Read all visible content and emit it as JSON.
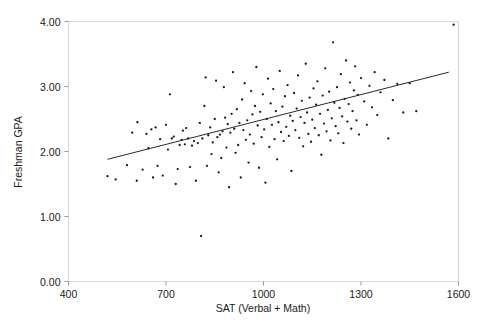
{
  "chart_data": {
    "type": "scatter",
    "title": "",
    "xlabel": "SAT (Verbal + Math)",
    "ylabel": "Freshman GPA",
    "xlim": [
      400,
      1600
    ],
    "ylim": [
      0.0,
      4.0
    ],
    "xticks": [
      400,
      700,
      1000,
      1300,
      1600
    ],
    "xtick_labels": [
      "400",
      "700",
      "1000",
      "1300",
      "1600"
    ],
    "yticks": [
      0.0,
      1.0,
      2.0,
      3.0,
      4.0
    ],
    "ytick_labels": [
      "0.00",
      "1.00",
      "2.00",
      "3.00",
      "4.00"
    ],
    "grid": false,
    "legend": null,
    "marker": "dot",
    "marker_color": "#1a1a1a",
    "trendline": {
      "label": "linear fit",
      "color": "#2a2a2a",
      "x_start": 520,
      "y_start": 1.88,
      "x_end": 1570,
      "y_end": 3.22
    },
    "points": [
      [
        520,
        1.62
      ],
      [
        545,
        1.57
      ],
      [
        580,
        1.79
      ],
      [
        596,
        2.29
      ],
      [
        610,
        1.55
      ],
      [
        612,
        2.45
      ],
      [
        628,
        1.72
      ],
      [
        640,
        2.27
      ],
      [
        646,
        2.05
      ],
      [
        655,
        2.34
      ],
      [
        660,
        1.6
      ],
      [
        668,
        2.37
      ],
      [
        674,
        1.78
      ],
      [
        682,
        2.19
      ],
      [
        690,
        1.63
      ],
      [
        700,
        2.41
      ],
      [
        706,
        2.03
      ],
      [
        712,
        2.88
      ],
      [
        718,
        2.2
      ],
      [
        724,
        2.23
      ],
      [
        730,
        1.5
      ],
      [
        736,
        1.73
      ],
      [
        742,
        2.1
      ],
      [
        748,
        2.18
      ],
      [
        752,
        2.32
      ],
      [
        758,
        2.11
      ],
      [
        762,
        2.36
      ],
      [
        768,
        2.2
      ],
      [
        774,
        1.76
      ],
      [
        780,
        2.09
      ],
      [
        786,
        2.16
      ],
      [
        792,
        1.55
      ],
      [
        798,
        2.13
      ],
      [
        804,
        2.44
      ],
      [
        808,
        0.7
      ],
      [
        812,
        2.2
      ],
      [
        818,
        2.7
      ],
      [
        822,
        3.14
      ],
      [
        826,
        1.78
      ],
      [
        830,
        2.25
      ],
      [
        836,
        2.37
      ],
      [
        840,
        1.96
      ],
      [
        844,
        2.14
      ],
      [
        850,
        2.5
      ],
      [
        854,
        3.09
      ],
      [
        858,
        2.22
      ],
      [
        862,
        1.68
      ],
      [
        866,
        2.26
      ],
      [
        870,
        1.9
      ],
      [
        874,
        2.31
      ],
      [
        878,
        2.99
      ],
      [
        882,
        2.52
      ],
      [
        886,
        2.06
      ],
      [
        890,
        2.42
      ],
      [
        894,
        1.45
      ],
      [
        898,
        2.29
      ],
      [
        902,
        2.58
      ],
      [
        906,
        3.22
      ],
      [
        910,
        2.35
      ],
      [
        914,
        1.98
      ],
      [
        918,
        2.65
      ],
      [
        922,
        2.1
      ],
      [
        926,
        2.44
      ],
      [
        930,
        1.6
      ],
      [
        934,
        2.8
      ],
      [
        938,
        2.33
      ],
      [
        942,
        3.05
      ],
      [
        946,
        2.18
      ],
      [
        950,
        2.48
      ],
      [
        954,
        1.83
      ],
      [
        958,
        2.26
      ],
      [
        962,
        2.93
      ],
      [
        966,
        2.57
      ],
      [
        970,
        2.12
      ],
      [
        974,
        2.7
      ],
      [
        978,
        3.3
      ],
      [
        982,
        2.4
      ],
      [
        986,
        1.75
      ],
      [
        990,
        2.61
      ],
      [
        994,
        2.22
      ],
      [
        998,
        2.88
      ],
      [
        1002,
        2.34
      ],
      [
        1006,
        1.52
      ],
      [
        1010,
        2.5
      ],
      [
        1014,
        3.12
      ],
      [
        1018,
        2.07
      ],
      [
        1022,
        2.74
      ],
      [
        1026,
        2.41
      ],
      [
        1030,
        2.96
      ],
      [
        1034,
        2.19
      ],
      [
        1038,
        2.62
      ],
      [
        1042,
        1.88
      ],
      [
        1046,
        2.45
      ],
      [
        1050,
        3.24
      ],
      [
        1054,
        2.3
      ],
      [
        1058,
        2.69
      ],
      [
        1062,
        2.16
      ],
      [
        1066,
        2.85
      ],
      [
        1070,
        2.38
      ],
      [
        1074,
        3.02
      ],
      [
        1078,
        2.24
      ],
      [
        1082,
        2.55
      ],
      [
        1086,
        1.7
      ],
      [
        1090,
        2.47
      ],
      [
        1094,
        2.9
      ],
      [
        1098,
        2.33
      ],
      [
        1102,
        2.66
      ],
      [
        1106,
        3.17
      ],
      [
        1110,
        2.21
      ],
      [
        1114,
        2.53
      ],
      [
        1118,
        2.78
      ],
      [
        1122,
        2.08
      ],
      [
        1126,
        2.44
      ],
      [
        1130,
        3.35
      ],
      [
        1134,
        2.6
      ],
      [
        1138,
        2.27
      ],
      [
        1142,
        2.83
      ],
      [
        1146,
        2.15
      ],
      [
        1150,
        2.49
      ],
      [
        1154,
        2.97
      ],
      [
        1158,
        2.36
      ],
      [
        1162,
        2.72
      ],
      [
        1166,
        3.08
      ],
      [
        1170,
        2.25
      ],
      [
        1174,
        2.58
      ],
      [
        1178,
        1.95
      ],
      [
        1182,
        2.86
      ],
      [
        1186,
        2.43
      ],
      [
        1190,
        3.28
      ],
      [
        1194,
        2.31
      ],
      [
        1198,
        2.64
      ],
      [
        1202,
        2.92
      ],
      [
        1206,
        2.17
      ],
      [
        1210,
        2.51
      ],
      [
        1214,
        3.68
      ],
      [
        1218,
        2.75
      ],
      [
        1222,
        2.39
      ],
      [
        1226,
        2.99
      ],
      [
        1230,
        2.28
      ],
      [
        1234,
        2.67
      ],
      [
        1238,
        3.19
      ],
      [
        1242,
        2.54
      ],
      [
        1246,
        2.13
      ],
      [
        1250,
        2.81
      ],
      [
        1254,
        3.4
      ],
      [
        1258,
        2.46
      ],
      [
        1262,
        2.73
      ],
      [
        1266,
        3.06
      ],
      [
        1270,
        2.35
      ],
      [
        1274,
        2.62
      ],
      [
        1278,
        2.94
      ],
      [
        1282,
        3.31
      ],
      [
        1286,
        2.48
      ],
      [
        1290,
        2.87
      ],
      [
        1294,
        2.26
      ],
      [
        1300,
        3.13
      ],
      [
        1310,
        2.77
      ],
      [
        1318,
        2.41
      ],
      [
        1326,
        3.01
      ],
      [
        1334,
        2.68
      ],
      [
        1342,
        3.22
      ],
      [
        1350,
        2.56
      ],
      [
        1360,
        2.91
      ],
      [
        1372,
        3.1
      ],
      [
        1384,
        2.2
      ],
      [
        1398,
        2.79
      ],
      [
        1412,
        3.04
      ],
      [
        1430,
        2.6
      ],
      [
        1450,
        3.05
      ],
      [
        1470,
        2.62
      ],
      [
        1585,
        3.95
      ]
    ]
  }
}
